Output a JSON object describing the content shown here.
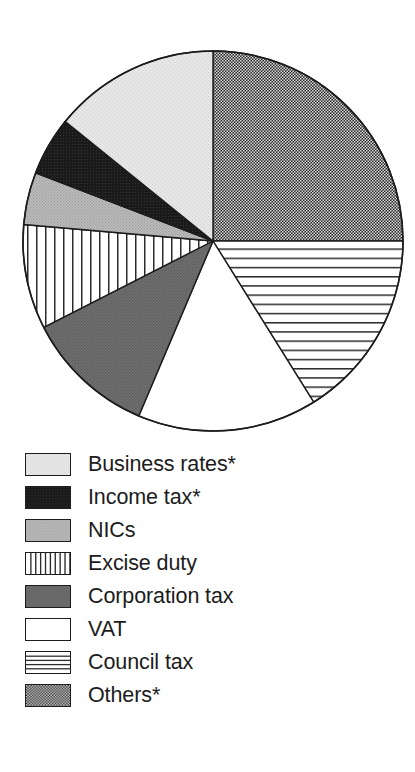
{
  "chart_data": {
    "type": "pie",
    "title": "",
    "subtitle": "",
    "xlabel": "",
    "ylabel": "",
    "grid": false,
    "legend_position": "bottom-left",
    "start_angle_deg": 0,
    "direction": "clockwise",
    "center": {
      "x": 213,
      "y": 241
    },
    "radius": 190,
    "categories": [
      "Others*",
      "Council tax",
      "VAT",
      "Corporation tax",
      "Excise duty",
      "NICs",
      "Income tax*",
      "Business rates*"
    ],
    "values": [
      25.0,
      16.1,
      15.3,
      11.1,
      8.9,
      4.4,
      5.0,
      14.2
    ],
    "slices": [
      {
        "label": "Others*",
        "value": 25.0,
        "start_deg": 0,
        "end_deg": 90,
        "fill": "checker-dark",
        "swatch_key": "others"
      },
      {
        "label": "Council tax",
        "value": 16.1,
        "start_deg": 90,
        "end_deg": 148,
        "fill": "hlines",
        "swatch_key": "council_tax"
      },
      {
        "label": "VAT",
        "value": 15.3,
        "start_deg": 148,
        "end_deg": 203,
        "fill": "white",
        "swatch_key": "vat"
      },
      {
        "label": "Corporation tax",
        "value": 11.1,
        "start_deg": 203,
        "end_deg": 243,
        "fill": "gray-dark",
        "swatch_key": "corporation_tax"
      },
      {
        "label": "Excise duty",
        "value": 8.9,
        "start_deg": 243,
        "end_deg": 275,
        "fill": "vlines",
        "swatch_key": "excise_duty"
      },
      {
        "label": "NICs",
        "value": 4.4,
        "start_deg": 275,
        "end_deg": 291,
        "fill": "gray-mid",
        "swatch_key": "nics"
      },
      {
        "label": "Income tax*",
        "value": 5.0,
        "start_deg": 291,
        "end_deg": 309,
        "fill": "black",
        "swatch_key": "income_tax"
      },
      {
        "label": "Business rates*",
        "value": 14.2,
        "start_deg": 309,
        "end_deg": 360,
        "fill": "gray-light",
        "swatch_key": "business_rates"
      }
    ]
  },
  "legend": {
    "items": [
      {
        "label": "Business rates*",
        "pattern": "gray-light",
        "swatch_name": "legend-swatch-business-rates"
      },
      {
        "label": "Income tax*",
        "pattern": "black",
        "swatch_name": "legend-swatch-income-tax"
      },
      {
        "label": "NICs",
        "pattern": "gray-mid",
        "swatch_name": "legend-swatch-nics"
      },
      {
        "label": "Excise duty",
        "pattern": "vlines",
        "swatch_name": "legend-swatch-excise-duty"
      },
      {
        "label": "Corporation tax",
        "pattern": "gray-dark",
        "swatch_name": "legend-swatch-corporation-tax"
      },
      {
        "label": "VAT",
        "pattern": "white",
        "swatch_name": "legend-swatch-vat"
      },
      {
        "label": "Council tax",
        "pattern": "hlines",
        "swatch_name": "legend-swatch-council-tax"
      },
      {
        "label": "Others*",
        "pattern": "checker-dark",
        "swatch_name": "legend-swatch-others"
      }
    ]
  },
  "colors": {
    "outline": "#1c1c1c",
    "text": "#1c1c1c",
    "background": "#ffffff",
    "gray_light": "#e2e2e2",
    "gray_mid": "#b2b2b2",
    "gray_dark": "#6e6e6e",
    "black": "#1a1a1a",
    "white": "#ffffff"
  }
}
